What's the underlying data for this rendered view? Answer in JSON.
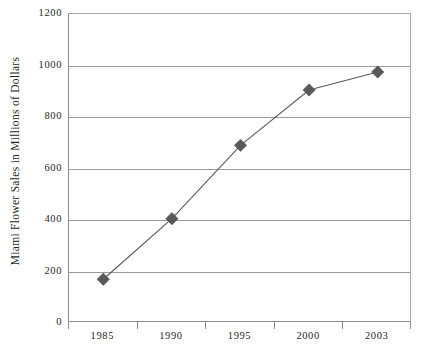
{
  "chart_data": {
    "type": "line",
    "title": "",
    "xlabel": "",
    "ylabel": "Miami Flower Sales in Millions of Dollars",
    "categories": [
      "1985",
      "1990",
      "1995",
      "2000",
      "2003"
    ],
    "values": [
      170,
      405,
      690,
      905,
      975
    ],
    "series": [
      {
        "name": "Miami Flower Sales",
        "values": [
          170,
          405,
          690,
          905,
          975
        ]
      }
    ],
    "ylim": [
      0,
      1200
    ],
    "y_ticks": [
      0,
      200,
      400,
      600,
      800,
      1000,
      1200
    ],
    "y_tick_labels": [
      "0",
      "200",
      "400",
      "600",
      "800",
      "1000",
      "1200"
    ],
    "x_tick_labels": [
      "1985",
      "1990",
      "1995",
      "2000",
      "2003"
    ],
    "grid": true,
    "grid_axis": "y",
    "legend": false,
    "legend_position": "none",
    "marker": "diamond",
    "marker_color": "#595959",
    "line_color": "#595959",
    "gridline_color": "#9a9a9a",
    "axis_color": "#8c8c8c",
    "background_color": "#ffffff",
    "text_color": "#262626"
  }
}
